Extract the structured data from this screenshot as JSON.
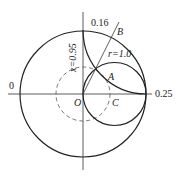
{
  "labels": {
    "zero": "0",
    "quarter": "0.25",
    "point16": "0.16",
    "B": "B",
    "A": "A",
    "O": "O",
    "C": "C",
    "r": "r=1.0",
    "x": "x=0.95"
  }
}
